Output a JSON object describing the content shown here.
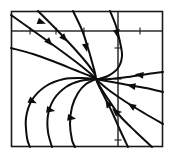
{
  "figure": {
    "title": "",
    "kind": "phase-portrait",
    "background_color": "#ffffff",
    "line_color": "#0d0d0d",
    "axis_color": "#2b2b2b",
    "frame_color": "#1a1a1a"
  },
  "chart_data": {
    "type": "line",
    "title": "",
    "subtitle": "",
    "xlabel": "",
    "ylabel": "",
    "grid": false,
    "legend": "none",
    "xlim": [
      -3,
      2
    ],
    "ylim": [
      -3,
      2
    ],
    "axis_origin_px": [
      118,
      31
    ],
    "plot_box_px": [
      11,
      11,
      163,
      147
    ],
    "critical_point_px": [
      96,
      79
    ],
    "critical_point_type": "improper node (stable, degenerate)",
    "flow_direction": "inward toward node",
    "annotations": [
      "All trajectories converge on a single stable node located left of and below the axis crossing.",
      "Arrowheads on every trajectory point toward the node."
    ],
    "series": [
      {
        "name": "trajectory-ul-1",
        "path_px": [
          [
            11,
            15
          ],
          [
            35,
            32
          ],
          [
            60,
            50
          ],
          [
            80,
            65
          ],
          [
            92,
            75
          ],
          [
            96,
            79
          ]
        ],
        "arrows_px": [
          [
            49,
            42,
            47
          ]
        ]
      },
      {
        "name": "trajectory-ul-2",
        "path_px": [
          [
            38,
            11
          ],
          [
            55,
            28
          ],
          [
            72,
            46
          ],
          [
            86,
            62
          ],
          [
            94,
            73
          ],
          [
            96,
            79
          ]
        ],
        "arrows_px": [
          [
            64,
            38,
            47
          ]
        ]
      },
      {
        "name": "trajectory-ul-3",
        "path_px": [
          [
            11,
            48
          ],
          [
            33,
            54
          ],
          [
            55,
            62
          ],
          [
            75,
            70
          ],
          [
            90,
            76
          ],
          [
            96,
            79
          ]
        ],
        "arrows_px": [
          [
            41,
            22,
            20
          ]
        ]
      },
      {
        "name": "trajectory-top-1",
        "path_px": [
          [
            73,
            11
          ],
          [
            82,
            30
          ],
          [
            88,
            48
          ],
          [
            92,
            62
          ],
          [
            95,
            73
          ],
          [
            96,
            79
          ]
        ],
        "arrows_px": [
          [
            86,
            47,
            79
          ]
        ]
      },
      {
        "name": "trajectory-top-2",
        "path_px": [
          [
            110,
            11
          ],
          [
            116,
            26
          ],
          [
            120,
            42
          ],
          [
            122,
            56
          ],
          [
            118,
            68
          ],
          [
            108,
            76
          ],
          [
            98,
            79
          ],
          [
            96,
            79
          ]
        ],
        "arrows_px": [
          [
            117,
            33,
            80
          ]
        ]
      },
      {
        "name": "trajectory-right-horizontal",
        "path_px": [
          [
            163,
            72
          ],
          [
            148,
            74
          ],
          [
            128,
            77
          ],
          [
            110,
            79
          ],
          [
            96,
            79
          ]
        ],
        "arrows_px": [
          [
            140,
            75,
            187
          ]
        ]
      },
      {
        "name": "trajectory-lr-1",
        "path_px": [
          [
            163,
            92
          ],
          [
            146,
            88
          ],
          [
            128,
            85
          ],
          [
            112,
            82
          ],
          [
            100,
            80
          ],
          [
            96,
            79
          ]
        ],
        "arrows_px": [
          [
            132,
            86,
            190
          ]
        ]
      },
      {
        "name": "trajectory-lr-2",
        "path_px": [
          [
            163,
            124
          ],
          [
            144,
            113
          ],
          [
            126,
            102
          ],
          [
            110,
            91
          ],
          [
            99,
            82
          ],
          [
            96,
            79
          ]
        ],
        "arrows_px": [
          [
            132,
            106,
            212
          ]
        ]
      },
      {
        "name": "trajectory-lr-3",
        "path_px": [
          [
            152,
            147
          ],
          [
            136,
            132
          ],
          [
            120,
            116
          ],
          [
            108,
            99
          ],
          [
            99,
            85
          ],
          [
            96,
            79
          ]
        ],
        "arrows_px": [
          [
            116,
            112,
            223
          ]
        ]
      },
      {
        "name": "trajectory-lr-4",
        "path_px": [
          [
            128,
            147
          ],
          [
            120,
            130
          ],
          [
            112,
            112
          ],
          [
            104,
            96
          ],
          [
            98,
            84
          ],
          [
            96,
            79
          ]
        ],
        "arrows_px": [
          [
            108,
            104,
            241
          ]
        ]
      },
      {
        "name": "trajectory-ll-1",
        "path_px": [
          [
            96,
            79
          ],
          [
            82,
            78
          ],
          [
            64,
            79
          ],
          [
            46,
            86
          ],
          [
            32,
            100
          ],
          [
            26,
            118
          ],
          [
            27,
            138
          ],
          [
            30,
            147
          ]
        ],
        "arrows_px": [
          [
            32,
            101,
            25
          ]
        ]
      },
      {
        "name": "trajectory-ll-2",
        "path_px": [
          [
            96,
            79
          ],
          [
            80,
            81
          ],
          [
            66,
            87
          ],
          [
            54,
            99
          ],
          [
            48,
            115
          ],
          [
            48,
            132
          ],
          [
            52,
            147
          ]
        ],
        "arrows_px": [
          [
            50,
            110,
            10
          ]
        ]
      },
      {
        "name": "trajectory-ll-3",
        "path_px": [
          [
            96,
            79
          ],
          [
            86,
            84
          ],
          [
            78,
            93
          ],
          [
            72,
            107
          ],
          [
            70,
            124
          ],
          [
            72,
            140
          ],
          [
            75,
            147
          ]
        ],
        "arrows_px": [
          [
            71,
            118,
            9
          ]
        ]
      }
    ],
    "x_ticks_px": [
      30,
      56,
      84,
      118,
      140
    ],
    "y_ticks_px": [
      48,
      79,
      112,
      140
    ]
  }
}
